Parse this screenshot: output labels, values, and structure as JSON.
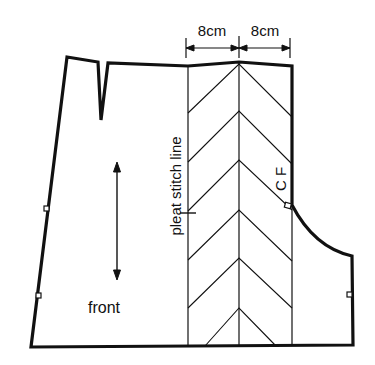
{
  "diagram": {
    "colors": {
      "line": "#111111",
      "background": "#ffffff"
    },
    "labels": {
      "dimension_left": "8cm",
      "dimension_right": "8cm",
      "pleat_line": "pleat stitch line",
      "centre_front": "C F",
      "piece_name": "front"
    },
    "pieces": [
      {
        "name": "front",
        "features": [
          "waist dart",
          "straight grain arrow",
          "side notches",
          "crotch curve",
          "centre front notch"
        ]
      }
    ],
    "pleat": {
      "total_width_cm": 16,
      "sections": [
        {
          "width_cm": 8
        },
        {
          "width_cm": 8
        }
      ],
      "pattern": "chevron fold lines"
    }
  }
}
